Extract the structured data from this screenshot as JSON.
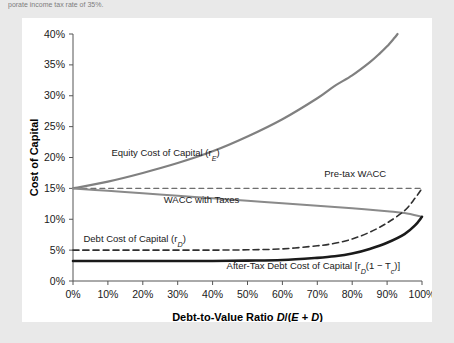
{
  "top_caption": "porate income tax rate of 35%.",
  "panel": {
    "background": "#ffffff"
  },
  "chart_data": {
    "type": "line",
    "title": "",
    "xlabel": "Debt-to-Value Ratio D/(E + D)",
    "ylabel": "Cost of Capital",
    "xlim": [
      0,
      100
    ],
    "ylim": [
      0,
      40
    ],
    "grid": false,
    "legend_position": "inline-annotations",
    "xtick_labels": [
      "0%",
      "10%",
      "20%",
      "30%",
      "40%",
      "50%",
      "60%",
      "70%",
      "80%",
      "90%",
      "100%"
    ],
    "xtick_values": [
      0,
      10,
      20,
      30,
      40,
      50,
      60,
      70,
      80,
      90,
      100
    ],
    "ytick_labels": [
      "0%",
      "5%",
      "10%",
      "15%",
      "20%",
      "25%",
      "30%",
      "35%",
      "40%"
    ],
    "ytick_values": [
      0,
      5,
      10,
      15,
      20,
      25,
      30,
      35,
      40
    ],
    "x": [
      0,
      10,
      20,
      30,
      40,
      50,
      60,
      70,
      80,
      85,
      90,
      93
    ],
    "series": [
      {
        "name": "Equity Cost of Capital (rE)",
        "label": "Equity Cost of Capital (r",
        "label_sub": "E",
        "label_tail": ")",
        "color": "#808080",
        "style": "solid",
        "width": 2.2,
        "x": [
          0,
          10,
          20,
          30,
          40,
          50,
          60,
          70,
          75,
          80,
          85,
          88,
          90,
          92,
          93
        ],
        "values": [
          15.0,
          16.1,
          17.5,
          19.1,
          21.0,
          23.4,
          26.2,
          29.6,
          31.6,
          33.3,
          35.4,
          36.9,
          38.0,
          39.3,
          40.0
        ]
      },
      {
        "name": "Pre-tax WACC",
        "label": "Pre-tax WACC",
        "color": "#6e6e6e",
        "style": "dashed",
        "width": 1.2,
        "x": [
          0,
          100
        ],
        "values": [
          15.0,
          15.0
        ]
      },
      {
        "name": "WACC with Taxes",
        "label": "WACC with Taxes",
        "color": "#8a8a8a",
        "style": "solid",
        "width": 2.0,
        "x": [
          0,
          10,
          20,
          30,
          40,
          50,
          60,
          70,
          80,
          90,
          95,
          100
        ],
        "values": [
          15.0,
          14.6,
          14.2,
          13.8,
          13.4,
          13.0,
          12.6,
          12.2,
          11.8,
          11.3,
          11.0,
          10.4
        ]
      },
      {
        "name": "Debt Cost of Capital (rD)",
        "label": "Debt Cost of Capital (r",
        "label_sub": "D",
        "label_tail": ")",
        "color": "#303030",
        "style": "dashed",
        "width": 1.6,
        "x": [
          0,
          10,
          20,
          30,
          40,
          50,
          60,
          70,
          75,
          80,
          85,
          90,
          95,
          98,
          100
        ],
        "values": [
          5.0,
          5.0,
          5.0,
          5.0,
          5.0,
          5.05,
          5.2,
          5.7,
          6.1,
          6.8,
          7.9,
          9.4,
          11.4,
          13.4,
          15.0
        ]
      },
      {
        "name": "After-Tax Debt Cost of Capital [rD(1 - Tc)]",
        "label_pre": "After-Tax Debt Cost of Capital [r",
        "label_sub": "D",
        "label_mid": "(1 − T",
        "label_sub2": "c",
        "label_tail": ")]",
        "color": "#1a1a1a",
        "style": "solid",
        "width": 2.6,
        "x": [
          0,
          10,
          20,
          30,
          40,
          50,
          60,
          70,
          75,
          80,
          85,
          90,
          95,
          98,
          100
        ],
        "values": [
          3.25,
          3.25,
          3.25,
          3.25,
          3.25,
          3.3,
          3.4,
          3.75,
          4.0,
          4.45,
          5.2,
          6.2,
          7.6,
          9.0,
          10.4
        ]
      }
    ],
    "annotations": [
      {
        "name": "equity-label",
        "text": "Equity Cost of Capital (rE)",
        "x": 11,
        "y": 20.2
      },
      {
        "name": "pretax-wacc-label",
        "text": "Pre-tax WACC",
        "x": 72,
        "y": 16.9
      },
      {
        "name": "wacc-taxes-label",
        "text": "WACC with Taxes",
        "x": 26,
        "y": 12.6
      },
      {
        "name": "debt-label",
        "text": "Debt Cost of Capital (rD)",
        "x": 3,
        "y": 6.3
      },
      {
        "name": "aftertax-label",
        "text": "After-Tax Debt Cost of Capital [rD(1 - Tc)]",
        "x": 44,
        "y": 2.0
      }
    ]
  }
}
